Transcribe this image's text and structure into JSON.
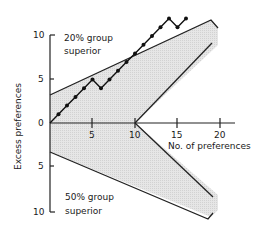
{
  "chart_data": {
    "type": "line",
    "title": "",
    "xlabel": "No. of preferences",
    "ylabel": "Excess preferences",
    "xlim": [
      0,
      20
    ],
    "ylim": [
      -10,
      10
    ],
    "x_ticks": [
      "5",
      "10",
      "15",
      "20"
    ],
    "y_ticks_upper": [
      "10",
      "5",
      "0"
    ],
    "y_ticks_lower": [
      "5",
      "10"
    ],
    "annotations": [
      {
        "text": "20% group superior",
        "lines": [
          "20% group",
          "superior"
        ],
        "region": "upper"
      },
      {
        "text": "50% group superior",
        "lines": [
          "50% group",
          "superior"
        ],
        "region": "lower"
      }
    ],
    "series": [
      {
        "name": "Excess preferences (sequential)",
        "x": [
          0,
          1,
          2,
          3,
          4,
          5,
          6,
          7,
          8,
          9,
          10,
          11,
          12,
          13,
          14,
          15,
          16
        ],
        "y": [
          0,
          1,
          2,
          3,
          4,
          5,
          4,
          5,
          6,
          7,
          8,
          9,
          10,
          11,
          12,
          11,
          12
        ]
      }
    ],
    "boundaries": {
      "upper_outer": {
        "x": [
          0,
          19,
          20
        ],
        "y": [
          3.3,
          11.2,
          10
        ]
      },
      "upper_inner": {
        "x": [
          10,
          20
        ],
        "y": [
          0,
          9
        ]
      },
      "lower_outer": {
        "x": [
          0,
          19.5,
          20
        ],
        "y": [
          -3.3,
          -11.3,
          -10.5
        ]
      },
      "lower_inner": {
        "x": [
          10,
          20
        ],
        "y": [
          0,
          -8.3
        ]
      }
    },
    "shaded_regions": [
      "continue-sampling zone between outer and inner boundaries"
    ],
    "grid": false,
    "legend": "none"
  },
  "labels": {
    "upper_line1": "20% group",
    "upper_line2": "superior",
    "lower_line1": "50% group",
    "lower_line2": "superior",
    "xlabel": "No. of preferences",
    "ylabel": "Excess preferences",
    "xt5": "5",
    "xt10": "10",
    "xt15": "15",
    "xt20": "20",
    "yt10u": "10",
    "yt5u": "5",
    "yt0": "0",
    "yt5l": "5",
    "yt10l": "10"
  }
}
